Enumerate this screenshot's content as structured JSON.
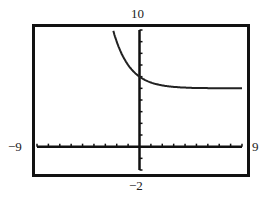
{
  "chart_data": {
    "type": "line",
    "title": "",
    "xlabel": "",
    "ylabel": "",
    "xlim": [
      -9,
      9
    ],
    "ylim": [
      -2,
      10
    ],
    "x_tick_step": 1,
    "y_tick_step": 1,
    "grid": false,
    "window_labels": {
      "ymax": "10",
      "ymin": "-2",
      "xmin": "-9",
      "xmax": "9"
    },
    "series": [
      {
        "name": "f(x)",
        "function": "5 + 2^(-x)",
        "horizontal_asymptote": 5,
        "x": [
          -2.3,
          -2,
          -1.5,
          -1,
          -0.5,
          0,
          0.5,
          1,
          2,
          3,
          4,
          5,
          6,
          7,
          8,
          9
        ],
        "y": [
          9.9,
          9,
          7.83,
          7,
          6.41,
          6,
          5.71,
          5.5,
          5.25,
          5.13,
          5.06,
          5.03,
          5.02,
          5.01,
          5.0,
          5.0
        ]
      }
    ]
  },
  "labels": {
    "ymax": "10",
    "ymin": "−2",
    "xmin": "−9",
    "xmax": "9"
  }
}
